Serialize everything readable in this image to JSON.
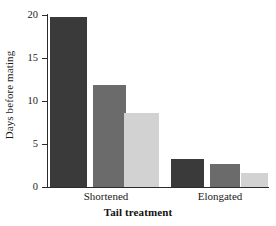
{
  "chart_data": {
    "type": "bar",
    "title": "",
    "xlabel": "Tail treatment",
    "ylabel": "Days before mating",
    "categories": [
      "Shortened",
      "Elongated"
    ],
    "ylim": [
      0,
      20
    ],
    "yticks": [
      0,
      5,
      10,
      15,
      20
    ],
    "ytick_labels": [
      "0",
      "5",
      "10",
      "15",
      "20"
    ],
    "grid": false,
    "legend": "none",
    "series": [
      {
        "name": "series-1",
        "color": "#3a3a3a",
        "values": [
          19.8,
          3.2
        ]
      },
      {
        "name": "series-2",
        "color": "#6b6b6b",
        "values": [
          11.9,
          2.7
        ]
      },
      {
        "name": "series-3",
        "color": "#d2d2d2",
        "values": [
          8.6,
          1.6
        ]
      }
    ],
    "bars": [
      {
        "group": "Shortened",
        "series": "series-1",
        "value": 19.8,
        "color": "#3a3a3a"
      },
      {
        "group": "Shortened",
        "series": "series-2",
        "value": 11.9,
        "color": "#6b6b6b"
      },
      {
        "group": "Shortened",
        "series": "series-3",
        "value": 8.6,
        "color": "#d2d2d2"
      },
      {
        "group": "Elongated",
        "series": "series-1",
        "value": 3.2,
        "color": "#3a3a3a"
      },
      {
        "group": "Elongated",
        "series": "series-2",
        "value": 2.7,
        "color": "#6b6b6b"
      },
      {
        "group": "Elongated",
        "series": "series-3",
        "value": 1.6,
        "color": "#d2d2d2"
      }
    ]
  },
  "axis": {
    "y_label": "Days before mating",
    "x_label": "Tail treatment",
    "y_tick_0": "0",
    "y_tick_1": "5",
    "y_tick_2": "10",
    "y_tick_3": "15",
    "y_tick_4": "20"
  },
  "groups": {
    "left_label": "Shortened",
    "right_label": "Elongated"
  },
  "colors": {
    "bar_dark": "#3a3a3a",
    "bar_mid": "#6b6b6b",
    "bar_light": "#d2d2d2",
    "axis": "#2b2b2b",
    "text": "#1a1a1a",
    "background": "#ffffff"
  }
}
